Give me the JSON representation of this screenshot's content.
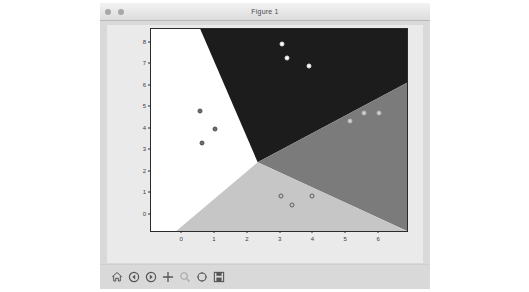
{
  "window": {
    "title": "Figure 1",
    "controls": [
      {
        "name": "close",
        "color": "#a8a8a8"
      },
      {
        "name": "minimize",
        "color": "#a8a8a8"
      }
    ]
  },
  "toolbar": {
    "items": [
      {
        "icon": "home-icon",
        "label": "Home",
        "enabled": true
      },
      {
        "icon": "back-arrow-icon",
        "label": "Back",
        "enabled": true
      },
      {
        "icon": "forward-arrow-icon",
        "label": "Forward",
        "enabled": true
      },
      {
        "icon": "pan-move-icon",
        "label": "Pan",
        "enabled": true
      },
      {
        "icon": "zoom-rect-icon",
        "label": "Zoom to rectangle",
        "enabled": false
      },
      {
        "icon": "subplot-config-icon",
        "label": "Configure subplots",
        "enabled": true
      },
      {
        "icon": "save-disk-icon",
        "label": "Save the figure",
        "enabled": true
      }
    ]
  },
  "chart_data": {
    "type": "scatter",
    "title": "",
    "xlabel": "",
    "ylabel": "",
    "xlim": [
      -0.95,
      6.85
    ],
    "ylim": [
      -0.75,
      8.65
    ],
    "xticks": [
      "0",
      "1",
      "2",
      "3",
      "4",
      "5",
      "6"
    ],
    "xtick_values": [
      0,
      1,
      2,
      3,
      4,
      5,
      6
    ],
    "yticks": [
      "0",
      "1",
      "2",
      "3",
      "4",
      "5",
      "6",
      "7",
      "8"
    ],
    "ytick_values": [
      0,
      1,
      2,
      3,
      4,
      5,
      6,
      7,
      8
    ],
    "grid": false,
    "legend": null,
    "background_regions": [
      {
        "name": "class-0-region",
        "color": "#ffffff",
        "position": "left"
      },
      {
        "name": "class-1-region",
        "color": "#1c1c1c",
        "position": "top"
      },
      {
        "name": "class-2-region",
        "color": "#7b7b7b",
        "position": "right"
      },
      {
        "name": "class-3-region",
        "color": "#c6c6c6",
        "position": "bottom"
      }
    ],
    "boundary_vertex": {
      "x": 2.3,
      "y": 2.45
    },
    "series": [
      {
        "name": "cluster-left",
        "marker_fill": "#6e6e6e",
        "marker_edge": "#4f4f4f",
        "points": [
          {
            "x": 0.55,
            "y": 4.85
          },
          {
            "x": 1.0,
            "y": 4.0
          },
          {
            "x": 0.6,
            "y": 3.35
          }
        ]
      },
      {
        "name": "cluster-top",
        "marker_fill": "#ffffff",
        "marker_edge": "#dcdcdc",
        "points": [
          {
            "x": 3.05,
            "y": 7.95
          },
          {
            "x": 3.2,
            "y": 7.3
          },
          {
            "x": 3.85,
            "y": 6.95
          }
        ]
      },
      {
        "name": "cluster-right",
        "marker_fill": "#d2d2d2",
        "marker_edge": "#b3b3b3",
        "points": [
          {
            "x": 5.55,
            "y": 4.75
          },
          {
            "x": 6.0,
            "y": 4.75
          },
          {
            "x": 5.1,
            "y": 4.35
          }
        ]
      },
      {
        "name": "cluster-bottom",
        "marker_fill": "#c6c6c6",
        "marker_edge": "#5c5c5c",
        "points": [
          {
            "x": 3.0,
            "y": 0.9
          },
          {
            "x": 3.35,
            "y": 0.45
          },
          {
            "x": 3.95,
            "y": 0.9
          }
        ]
      }
    ]
  }
}
